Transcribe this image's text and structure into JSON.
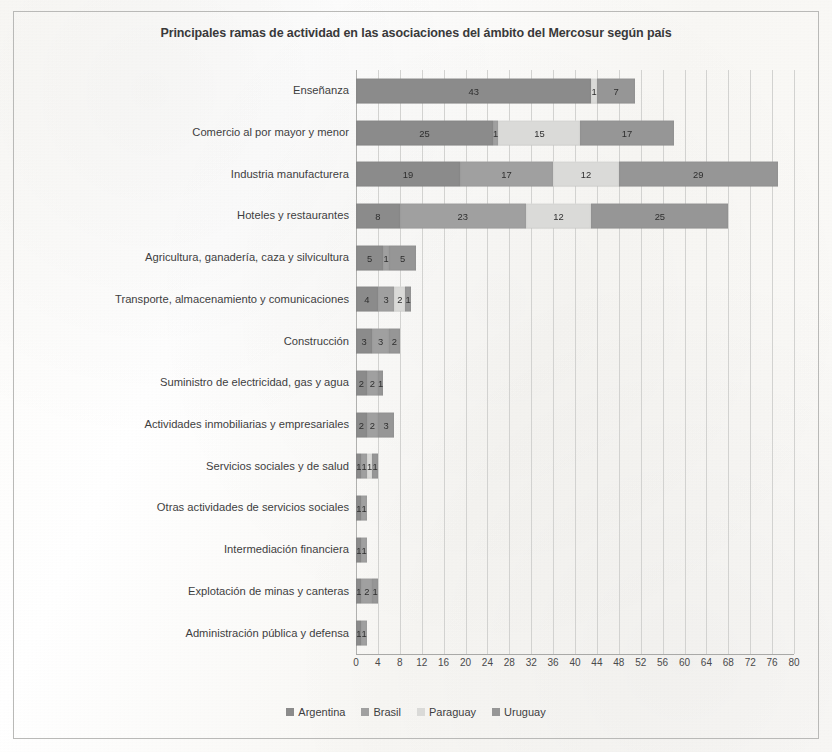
{
  "chart_data": {
    "type": "bar",
    "orientation": "horizontal",
    "stacked": true,
    "title": "Principales ramas de actividad en las asociaciones del ámbito del Mercosur según país",
    "xlabel": "",
    "ylabel": "",
    "xlim": [
      0,
      80
    ],
    "xticks": [
      0,
      4,
      8,
      12,
      16,
      20,
      24,
      28,
      32,
      36,
      40,
      44,
      48,
      52,
      56,
      60,
      64,
      68,
      72,
      76,
      80
    ],
    "grid": true,
    "legend_position": "bottom",
    "categories": [
      "Enseñanza",
      "Comercio al por mayor y menor",
      "Industria manufacturera",
      "Hoteles y restaurantes",
      "Agricultura, ganadería, caza y silvicultura",
      "Transporte, almacenamiento y comunicaciones",
      "Construcción",
      "Suministro de electricidad, gas y agua",
      "Actividades inmobiliarias y empresariales",
      "Servicios sociales y de salud",
      "Otras actividades de servicios sociales",
      "Intermediación financiera",
      "Explotación de minas y canteras",
      "Administración pública y defensa"
    ],
    "series": [
      {
        "name": "Argentina",
        "color": "#8b8b8b",
        "values": [
          43,
          25,
          19,
          8,
          5,
          4,
          3,
          2,
          2,
          1,
          1,
          1,
          1,
          1
        ]
      },
      {
        "name": "Brasil",
        "color": "#a0a0a0",
        "values": [
          0,
          1,
          17,
          23,
          1,
          3,
          3,
          2,
          2,
          1,
          1,
          1,
          2,
          1
        ]
      },
      {
        "name": "Paraguay",
        "color": "#dadad8",
        "values": [
          1,
          15,
          12,
          12,
          0,
          2,
          0,
          0,
          0,
          1,
          0,
          0,
          0,
          0
        ]
      },
      {
        "name": "Uruguay",
        "color": "#969696",
        "values": [
          7,
          17,
          29,
          25,
          5,
          1,
          2,
          1,
          3,
          1,
          0,
          0,
          1,
          0
        ]
      }
    ]
  }
}
